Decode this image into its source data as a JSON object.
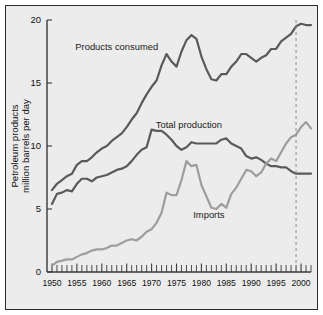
{
  "chart_data": {
    "type": "line",
    "title": "",
    "subtitle": "",
    "xlabel": "",
    "ylabel": "Petroleum products million barrels per day",
    "ylabel_line1": "Petroleum products",
    "ylabel_line2": "million barrels per day",
    "xlim": [
      1949,
      2002
    ],
    "ylim": [
      0,
      20
    ],
    "yticks": [
      0,
      5,
      10,
      15,
      20
    ],
    "ytick_labels": [
      "0",
      "5",
      "10",
      "15",
      "20"
    ],
    "xticks": [
      1950,
      1955,
      1960,
      1965,
      1970,
      1975,
      1980,
      1985,
      1990,
      1995,
      2000
    ],
    "xtick_labels": [
      "1950",
      "1955",
      "1960",
      "1965",
      "1970",
      "1975",
      "1980",
      "1985",
      "1990",
      "1995",
      "2000"
    ],
    "minor_xtick_interval": 1,
    "grid": false,
    "legend_position": "inline-annotations",
    "colors": {
      "products_consumed": "#5a5a5a",
      "total_production": "#5a5a5a",
      "imports": "#9d9d9d",
      "marker_line": "#8d8d8d",
      "plot_background": "#ececec",
      "frame_border": "#2b2b2b",
      "axis": "#3a3a3a"
    },
    "annotations": [
      {
        "name": "products-consumed-label",
        "text": "Products consumed",
        "x": 1963.0,
        "y": 17.6
      },
      {
        "name": "total-production-label",
        "text": "Total production",
        "x": 1977.5,
        "y": 11.4
      },
      {
        "name": "imports-label",
        "text": "Imports",
        "x": 1981.5,
        "y": 4.3
      }
    ],
    "marker_lines": [
      {
        "name": "year-1999-marker",
        "x": 1999,
        "y_from": 0,
        "y_to": 20,
        "style": "dashed"
      }
    ],
    "x": [
      1950,
      1951,
      1952,
      1953,
      1954,
      1955,
      1956,
      1957,
      1958,
      1959,
      1960,
      1961,
      1962,
      1963,
      1964,
      1965,
      1966,
      1967,
      1968,
      1969,
      1970,
      1971,
      1972,
      1973,
      1974,
      1975,
      1976,
      1977,
      1978,
      1979,
      1980,
      1981,
      1982,
      1983,
      1984,
      1985,
      1986,
      1987,
      1988,
      1989,
      1990,
      1991,
      1992,
      1993,
      1994,
      1995,
      1996,
      1997,
      1998,
      1999,
      2000,
      2001,
      2002
    ],
    "series": [
      {
        "name": "Products consumed",
        "color": "#5a5a5a",
        "values": [
          6.5,
          7.0,
          7.3,
          7.6,
          7.8,
          8.5,
          8.8,
          8.8,
          9.1,
          9.5,
          9.8,
          10.0,
          10.4,
          10.7,
          11.0,
          11.5,
          12.1,
          12.6,
          13.4,
          14.1,
          14.7,
          15.2,
          16.4,
          17.3,
          16.7,
          16.3,
          17.5,
          18.4,
          18.8,
          18.5,
          17.1,
          16.1,
          15.3,
          15.2,
          15.7,
          15.7,
          16.3,
          16.7,
          17.3,
          17.3,
          17.0,
          16.7,
          17.0,
          17.2,
          17.7,
          17.7,
          18.3,
          18.6,
          18.9,
          19.5,
          19.7,
          19.6,
          19.6
        ]
      },
      {
        "name": "Total production",
        "color": "#5a5a5a",
        "values": [
          5.4,
          6.2,
          6.3,
          6.5,
          6.4,
          7.0,
          7.4,
          7.4,
          7.2,
          7.5,
          7.6,
          7.7,
          7.9,
          8.1,
          8.2,
          8.4,
          8.8,
          9.3,
          9.7,
          9.9,
          11.3,
          11.2,
          11.2,
          10.9,
          10.5,
          10.0,
          9.7,
          9.9,
          10.3,
          10.2,
          10.2,
          10.2,
          10.2,
          10.2,
          10.5,
          10.6,
          10.2,
          10.0,
          9.8,
          9.2,
          9.0,
          9.1,
          8.9,
          8.6,
          8.4,
          8.4,
          8.3,
          8.3,
          8.0,
          7.8,
          7.8,
          7.8,
          7.8
        ]
      },
      {
        "name": "Imports",
        "color": "#9d9d9d",
        "values": [
          0.5,
          0.8,
          0.9,
          1.0,
          1.0,
          1.2,
          1.4,
          1.5,
          1.7,
          1.8,
          1.8,
          1.9,
          2.1,
          2.1,
          2.3,
          2.5,
          2.6,
          2.5,
          2.8,
          3.2,
          3.4,
          3.9,
          4.7,
          6.3,
          6.1,
          6.1,
          7.3,
          8.8,
          8.4,
          8.5,
          6.9,
          6.0,
          5.1,
          5.0,
          5.4,
          5.1,
          6.2,
          6.7,
          7.4,
          8.1,
          8.0,
          7.6,
          7.9,
          8.6,
          9.0,
          8.8,
          9.5,
          10.2,
          10.7,
          10.9,
          11.5,
          11.9,
          11.4
        ]
      }
    ]
  }
}
